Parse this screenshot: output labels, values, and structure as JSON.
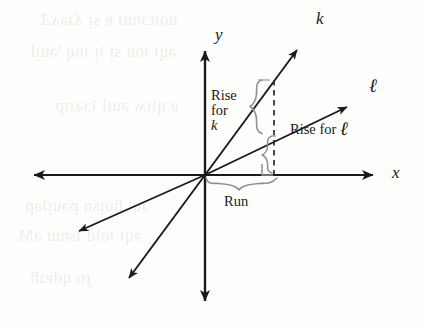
{
  "figure": {
    "kind": "coordinate-plane-slope-diagram",
    "background_color": "#fdfdfb",
    "ink_color": "#1a1a1a",
    "annotation_color": "#8f8f8f"
  },
  "axes": {
    "x_label": "x",
    "y_label": "y",
    "origin": {
      "x": 205,
      "y": 175
    },
    "x_axis": {
      "left_tip": {
        "x": 25,
        "y": 175
      },
      "right_tip": {
        "x": 382,
        "y": 175
      }
    },
    "y_axis": {
      "top_tip": {
        "x": 205,
        "y": 42
      },
      "bottom_tip": {
        "x": 205,
        "y": 310
      }
    }
  },
  "lines": [
    {
      "name": "line-k",
      "label": "k",
      "label_pos": {
        "x": 316,
        "y": 14
      },
      "arrow_tip": {
        "x": 306,
        "y": 41
      },
      "opposite_tip": {
        "x": 121,
        "y": 289
      },
      "slope_description": "steeper"
    },
    {
      "name": "line-l",
      "label": "ℓ",
      "label_pos": {
        "x": 371,
        "y": 83
      },
      "arrow_tip": {
        "x": 356,
        "y": 100
      },
      "opposite_tip": {
        "x": 69,
        "y": 236
      },
      "slope_description": "shallower"
    }
  ],
  "annotations": {
    "rise_for_k": {
      "lines": [
        "Rise",
        "for",
        "k"
      ],
      "italic_last_line": true,
      "pos": {
        "x": 211,
        "y": 90
      }
    },
    "rise_for_l": {
      "prefix": "Rise for ",
      "symbol": "ℓ",
      "pos": {
        "x": 294,
        "y": 126
      }
    },
    "run": {
      "text": "Run",
      "pos": {
        "x": 226,
        "y": 196
      }
    },
    "dashed_vertical": {
      "x": 274,
      "y_top": 80,
      "y_bottom": 175
    },
    "brace_rise_k": {
      "x": 258,
      "y_top": 80,
      "y_bottom": 133
    },
    "brace_rise_l": {
      "x": 276,
      "y_top": 136,
      "y_bottom": 173
    },
    "brace_run": {
      "y": 181,
      "x_left": 206,
      "x_right": 278
    },
    "right_angle_marker": {
      "x": 262,
      "y": 165,
      "size": 10
    }
  }
}
